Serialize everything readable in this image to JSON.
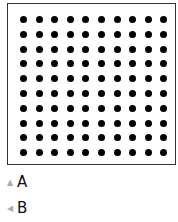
{
  "figure": {
    "grid_rows": 10,
    "grid_cols": 10,
    "dot_color": "#000000"
  },
  "options": [
    {
      "icon": "triangle-up-icon",
      "glyph": "▲",
      "label": "A"
    },
    {
      "icon": "triangle-left-icon",
      "glyph": "◀",
      "label": "B"
    }
  ]
}
